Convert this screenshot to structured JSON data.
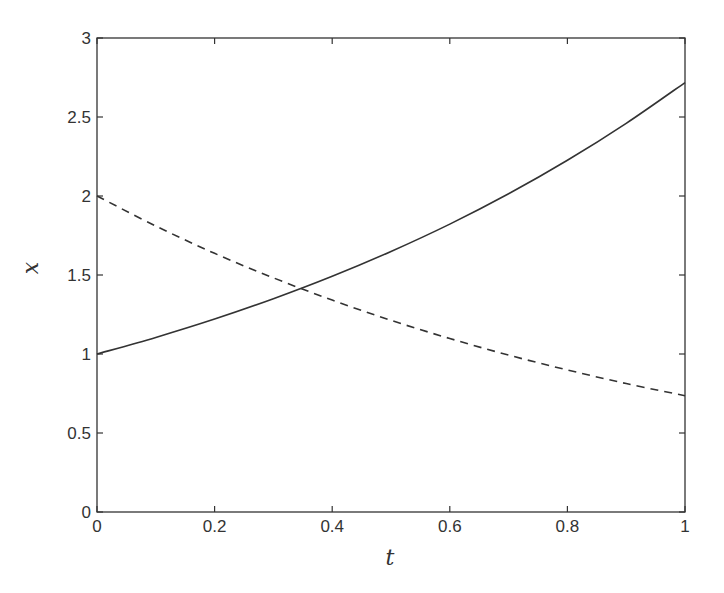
{
  "chart_data": {
    "type": "line",
    "title": "",
    "xlabel": "t",
    "ylabel": "x",
    "xlim": [
      0,
      1
    ],
    "ylim": [
      0,
      3
    ],
    "grid": false,
    "legend": null,
    "xticks": [
      0,
      0.2,
      0.4,
      0.6,
      0.8,
      1
    ],
    "xtick_labels": [
      "0",
      "0.2",
      "0.4",
      "0.6",
      "0.8",
      "1"
    ],
    "yticks": [
      0,
      0.5,
      1,
      1.5,
      2,
      2.5,
      3
    ],
    "ytick_labels": [
      "0",
      "0.5",
      "1",
      "1.5",
      "2",
      "2.5",
      "3"
    ],
    "x": [
      0,
      0.1,
      0.2,
      0.3,
      0.4,
      0.5,
      0.6,
      0.7,
      0.8,
      0.9,
      1.0
    ],
    "series": [
      {
        "name": "solid",
        "style": "solid",
        "color": "#333333",
        "values": [
          1.0,
          1.105,
          1.221,
          1.35,
          1.492,
          1.649,
          1.822,
          2.014,
          2.226,
          2.46,
          2.718
        ]
      },
      {
        "name": "dashed",
        "style": "dashed",
        "color": "#333333",
        "values": [
          2.0,
          1.81,
          1.637,
          1.482,
          1.341,
          1.213,
          1.098,
          0.993,
          0.899,
          0.813,
          0.736
        ]
      }
    ],
    "annotations": [
      {
        "type": "intersection",
        "x": 0.347,
        "y": 1.414
      }
    ]
  },
  "colors": {
    "axis": "#333333",
    "background": "#ffffff"
  }
}
